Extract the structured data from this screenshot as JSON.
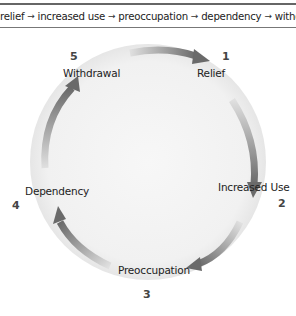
{
  "sequence": {
    "items": [
      "relief",
      "increased use",
      "preoccupation",
      "dependency",
      "withdrawal"
    ],
    "separator_icon": "arrow-right-icon"
  },
  "cycle": {
    "stages": [
      {
        "number": "1",
        "label": "Relief"
      },
      {
        "number": "2",
        "label": "Increased Use"
      },
      {
        "number": "3",
        "label": "Preoccupation"
      },
      {
        "number": "4",
        "label": "Dependency"
      },
      {
        "number": "5",
        "label": "Withdrawal"
      }
    ],
    "colors": {
      "circle_fill": "#f2f2f2",
      "circle_edge": "#e3e3e3",
      "arrow_dark": "#6e6e6e",
      "arrow_light": "#d8d8d8"
    }
  }
}
